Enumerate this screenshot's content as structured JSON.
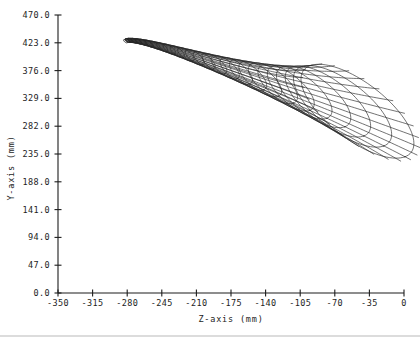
{
  "chart_data": {
    "type": "line",
    "title": "",
    "subtitle": "",
    "xlabel": "Z-axis  (mm)",
    "ylabel": "Y-axis  (mm)",
    "xlim": [
      -350,
      0
    ],
    "ylim": [
      0,
      470
    ],
    "xticks": [
      -350,
      -315,
      -280,
      -245,
      -210,
      -175,
      -140,
      -105,
      -70,
      -35,
      0
    ],
    "xtick_labels": [
      "-350",
      "-315",
      "-280",
      "-245",
      "-210",
      "-175",
      "-140",
      "-105",
      "-70",
      "-35",
      "0"
    ],
    "yticks": [
      0,
      47,
      94,
      141,
      188,
      235,
      282,
      329,
      376,
      423,
      470
    ],
    "ytick_labels": [
      "0.0",
      "47.0",
      "94.0",
      "141.0",
      "188.0",
      "235.0",
      "282.0",
      "329.0",
      "376.0",
      "423.0",
      "470.0"
    ],
    "grid": false,
    "legend": null,
    "annotations": [],
    "series": [
      {
        "name": "shell-surface-wireframe",
        "description": "Projection of a logarithmic-spiral (seashell / horn) 3D surface onto the Z-Y plane, drawn as a wireframe of circumferential rings plus longitudinal meridian curves.",
        "render": "parametric-mesh",
        "line_color": "#262626",
        "line_width": 0.65,
        "mesh": {
          "rings": 26,
          "meridians": 24,
          "ring_samples": 96,
          "apex_z": -282.0,
          "apex_y": 424.0,
          "mouth_center_z": -41.0,
          "mouth_center_y": 304.0,
          "growth_rate": 1.148,
          "start_radius_mm": 3.0,
          "end_radius_mm": 96.0,
          "tilt_deg": -58.0,
          "axis_ratio": 0.4,
          "spine_bow": 0.34,
          "dense_cap_rings": 7
        }
      }
    ]
  },
  "axes": {
    "x_axis_name": "Z-axis",
    "x_axis_unit": "(mm)",
    "y_axis_name": "Y-axis",
    "y_axis_unit": "(mm)"
  },
  "colors": {
    "background": "#ffffff",
    "ink": "#1d1d1d",
    "mesh": "#262626",
    "rule": "#b9b9b9"
  }
}
